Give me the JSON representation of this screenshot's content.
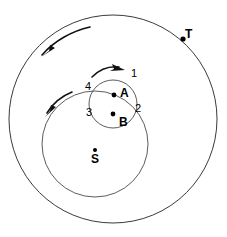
{
  "figure": {
    "background_color": "#ffffff",
    "line_color": "#3a3a3a",
    "arrow_color": "#111111",
    "width": 227,
    "height": 237
  },
  "bodies": [
    {
      "key": "T",
      "label": "T",
      "x": 183,
      "y": 39,
      "label_x": 185,
      "label_y": 28,
      "dot_r": 2.6
    },
    {
      "key": "S",
      "label": "S",
      "x": 95,
      "y": 150,
      "label_x": 91,
      "label_y": 153,
      "dot_r": 2.0
    },
    {
      "key": "A",
      "label": "A",
      "x": 114,
      "y": 95,
      "label_x": 120,
      "label_y": 87,
      "dot_r": 2.4
    },
    {
      "key": "B",
      "label": "B",
      "x": 113,
      "y": 114,
      "label_x": 119,
      "label_y": 116,
      "dot_r": 2.4
    }
  ],
  "labels": {
    "t": "T",
    "s": "S",
    "a": "A",
    "b": "B"
  },
  "numbers": [
    {
      "value": "1",
      "x": 131,
      "y": 68
    },
    {
      "value": "2",
      "x": 135,
      "y": 103
    },
    {
      "value": "3",
      "x": 86,
      "y": 107
    },
    {
      "value": "4",
      "x": 85,
      "y": 81
    }
  ],
  "orbits": [
    {
      "key": "outer-orbit",
      "name": "T-orbit",
      "cx": 113,
      "cy": 119,
      "r": 104
    },
    {
      "key": "middle-orbit",
      "name": "B-orbit",
      "cx": 95,
      "cy": 144,
      "r": 53
    },
    {
      "key": "small-orbit",
      "name": "A-epicycle",
      "cx": 113,
      "cy": 104,
      "r": 24
    }
  ],
  "direction_arrows": [
    {
      "key": "outer-arrow",
      "name": "outer-counterclockwise-arrow",
      "direction": "counterclockwise"
    },
    {
      "key": "middle-arrow",
      "name": "middle-counterclockwise-arrow",
      "direction": "counterclockwise"
    },
    {
      "key": "epicycle-arrow",
      "name": "epicycle-clockwise-arrow",
      "direction": "clockwise"
    }
  ]
}
